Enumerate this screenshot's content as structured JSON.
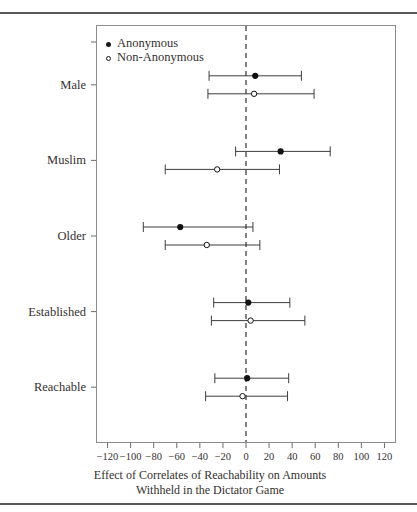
{
  "figure": {
    "axis_caption_line1": "Effect of Correlates of Reachability on Amounts",
    "axis_caption_line2": "Withheld in the Dictator Game"
  },
  "legend": {
    "items": [
      {
        "label": "Anonymous",
        "marker": "filled-circle"
      },
      {
        "label": "Non-Anonymous",
        "marker": "open-circle"
      }
    ]
  },
  "chart_data": {
    "type": "scatter",
    "subtype": "forest-plot-coefficient-plot",
    "title": "",
    "xlabel": "Effect of Correlates of Reachability on Amounts Withheld in the Dictator Game",
    "ylabel": "",
    "xlim": [
      -130,
      130
    ],
    "xticks": [
      -120,
      -100,
      -80,
      -60,
      -40,
      -20,
      0,
      20,
      40,
      60,
      80,
      100,
      120
    ],
    "xticklabels": [
      "−120",
      "−100",
      "−80",
      "−60",
      "−40",
      "−20",
      "0",
      "20",
      "40",
      "60",
      "80",
      "100",
      "120"
    ],
    "grid": false,
    "reference_line": {
      "x": 0,
      "style": "dashed"
    },
    "legend_position": "top-left-inside",
    "categories": [
      "Male",
      "Muslim",
      "Older",
      "Established",
      "Reachable"
    ],
    "series": [
      {
        "name": "Anonymous",
        "marker": "filled-circle",
        "values": [
          8,
          30,
          -57,
          2,
          1
        ],
        "ci_low": [
          -32,
          -9,
          -89,
          -28,
          -27
        ],
        "ci_high": [
          48,
          73,
          6,
          38,
          37
        ]
      },
      {
        "name": "Non-Anonymous",
        "marker": "open-circle",
        "values": [
          7,
          -25,
          -34,
          4,
          -3
        ],
        "ci_low": [
          -33,
          -70,
          -70,
          -30,
          -35
        ],
        "ci_high": [
          59,
          29,
          12,
          51,
          36
        ]
      }
    ]
  }
}
